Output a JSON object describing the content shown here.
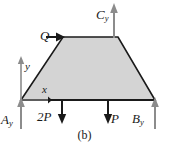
{
  "figure": {
    "caption": "(b)",
    "background_color": "#ffffff",
    "body": {
      "shape": "trapezoid",
      "fill_color": "#d4d4d4",
      "stroke_color": "#1a1a1a",
      "vertices": [
        {
          "name": "bottom-left",
          "x": 21,
          "y": 100
        },
        {
          "name": "top-left",
          "x": 63,
          "y": 37
        },
        {
          "name": "top-right",
          "x": 118,
          "y": 37
        },
        {
          "name": "bottom-right",
          "x": 155,
          "y": 100
        }
      ]
    },
    "axes": {
      "color": "#8c8c8c",
      "origin": {
        "x": 21,
        "y": 100
      },
      "y_label": "y",
      "x_label": "x",
      "y_axis": {
        "from_y": 100,
        "to_y": 57
      },
      "x_axis": {
        "from_x": 21,
        "to_x": 52
      }
    },
    "forces": [
      {
        "name": "Q",
        "label": "Q",
        "subscript": "",
        "kind": "applied-load",
        "direction": "right",
        "color": "#1a1a1a",
        "tail": {
          "x": 46,
          "y": 37
        },
        "head": {
          "x": 64,
          "y": 37
        }
      },
      {
        "name": "Cy",
        "label": "C",
        "subscript": "y",
        "kind": "reaction",
        "direction": "up",
        "color": "#8c8c8c",
        "tail": {
          "x": 114,
          "y": 37
        },
        "head": {
          "x": 114,
          "y": 4
        }
      },
      {
        "name": "Ay",
        "label": "A",
        "subscript": "y",
        "kind": "reaction",
        "direction": "up",
        "color": "#8c8c8c",
        "tail": {
          "x": 21,
          "y": 128
        },
        "head": {
          "x": 21,
          "y": 98
        }
      },
      {
        "name": "2P",
        "label": "2P",
        "subscript": "",
        "kind": "applied-load",
        "direction": "down",
        "color": "#1a1a1a",
        "tail": {
          "x": 62,
          "y": 100
        },
        "head": {
          "x": 62,
          "y": 123
        }
      },
      {
        "name": "P",
        "label": "P",
        "subscript": "",
        "kind": "applied-load",
        "direction": "down",
        "color": "#1a1a1a",
        "tail": {
          "x": 108,
          "y": 100
        },
        "head": {
          "x": 108,
          "y": 123
        }
      },
      {
        "name": "By",
        "label": "B",
        "subscript": "y",
        "kind": "reaction",
        "direction": "up",
        "color": "#8c8c8c",
        "tail": {
          "x": 155,
          "y": 128
        },
        "head": {
          "x": 155,
          "y": 98
        }
      }
    ],
    "ground_line": {
      "from_x": 21,
      "to_x": 155,
      "y": 100,
      "color": "#1a1a1a"
    }
  }
}
